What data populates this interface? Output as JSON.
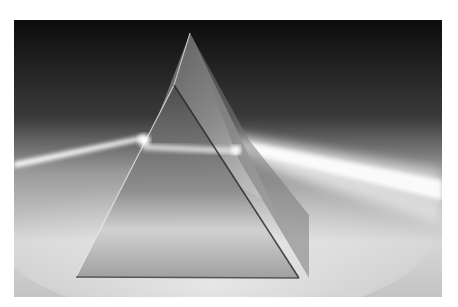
{
  "image": {
    "subject": "glass prism refracting a beam of light",
    "description": "Grayscale photograph of a triangular glass prism on a light surface with a white light beam entering from the left and a wider beam exiting to the right",
    "colors": {
      "background_top": "#0e0e0e",
      "background_bottom": "#d8d8d8",
      "beam": "#ffffff",
      "border": "#ffffff"
    }
  }
}
